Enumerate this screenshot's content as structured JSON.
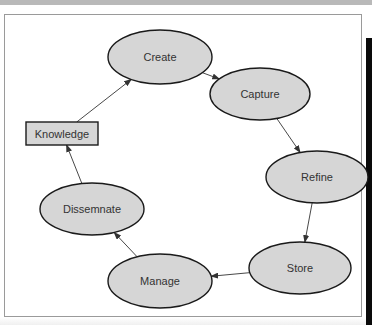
{
  "diagram": {
    "nodes": [
      {
        "id": "create",
        "label": "Create",
        "shape": "ellipse"
      },
      {
        "id": "capture",
        "label": "Capture",
        "shape": "ellipse"
      },
      {
        "id": "refine",
        "label": "Refine",
        "shape": "ellipse"
      },
      {
        "id": "store",
        "label": "Store",
        "shape": "ellipse"
      },
      {
        "id": "manage",
        "label": "Manage",
        "shape": "ellipse"
      },
      {
        "id": "dissemnate",
        "label": "Dissemnate",
        "shape": "ellipse"
      },
      {
        "id": "knowledge",
        "label": "Knowledge",
        "shape": "rectangle"
      }
    ],
    "edges": [
      {
        "from": "create",
        "to": "capture"
      },
      {
        "from": "capture",
        "to": "refine"
      },
      {
        "from": "refine",
        "to": "store"
      },
      {
        "from": "store",
        "to": "manage"
      },
      {
        "from": "manage",
        "to": "dissemnate"
      },
      {
        "from": "dissemnate",
        "to": "knowledge"
      },
      {
        "from": "knowledge",
        "to": "create"
      }
    ],
    "colors": {
      "node_fill": "#d6d6d6",
      "node_stroke": "#1a1a1a",
      "edge": "#333333",
      "text": "#333333"
    }
  }
}
